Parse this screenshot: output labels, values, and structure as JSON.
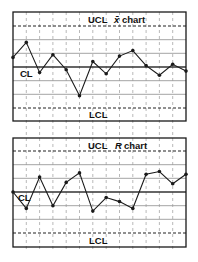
{
  "chart_data": [
    {
      "type": "line",
      "title": "x̄ chart",
      "title_symbol": "x̄",
      "title_suffix": "chart",
      "xlabel": "",
      "ylabel": "",
      "units": "sigma units relative to CL (estimated from gridlines)",
      "x": [
        1,
        2,
        3,
        4,
        5,
        6,
        7,
        8,
        9,
        10,
        11,
        12,
        13,
        14
      ],
      "values": [
        0.7,
        1.8,
        -0.4,
        0.9,
        -0.2,
        -2.1,
        0.4,
        -0.5,
        0.8,
        1.2,
        0.1,
        -0.6,
        0.2,
        -0.3
      ],
      "ylim": [
        -3.9,
        4.0
      ],
      "reference_lines": [
        {
          "label": "UCL",
          "value": 3,
          "style": "dashed"
        },
        {
          "label": "",
          "value": 2,
          "style": "solid-gray"
        },
        {
          "label": "",
          "value": 1,
          "style": "solid-gray"
        },
        {
          "label": "CL",
          "value": 0,
          "style": "solid-dark"
        },
        {
          "label": "",
          "value": -1,
          "style": "solid-gray"
        },
        {
          "label": "",
          "value": -2,
          "style": "solid-gray"
        },
        {
          "label": "LCL",
          "value": -3,
          "style": "dashed"
        }
      ],
      "grid": true,
      "legend": "none"
    },
    {
      "type": "line",
      "title": "R chart",
      "title_symbol": "R",
      "title_suffix": "chart",
      "xlabel": "",
      "ylabel": "",
      "units": "sigma units relative to CL (estimated from gridlines)",
      "x": [
        1,
        2,
        3,
        4,
        5,
        6,
        7,
        8,
        9,
        10,
        11,
        12,
        13,
        14
      ],
      "values": [
        0.0,
        -1.2,
        1.1,
        -1.0,
        0.7,
        1.4,
        -1.4,
        -0.4,
        -0.7,
        -1.2,
        1.3,
        1.5,
        0.6,
        1.3
      ],
      "ylim": [
        -4.0,
        4.0
      ],
      "reference_lines": [
        {
          "label": "UCL",
          "value": 3,
          "style": "dashed"
        },
        {
          "label": "",
          "value": 2,
          "style": "solid-gray"
        },
        {
          "label": "",
          "value": 1,
          "style": "solid-gray"
        },
        {
          "label": "CL",
          "value": 0,
          "style": "solid-dark"
        },
        {
          "label": "",
          "value": -1,
          "style": "solid-gray"
        },
        {
          "label": "",
          "value": -2,
          "style": "solid-gray"
        },
        {
          "label": "LCL",
          "value": -3,
          "style": "dashed"
        }
      ],
      "grid": true,
      "legend": "none"
    }
  ],
  "labels": {
    "xbar": {
      "ucl": "UCL",
      "cl": "CL",
      "lcl": "LCL",
      "title_symbol": "x̄",
      "title_suffix": "chart"
    },
    "r": {
      "ucl": "UCL",
      "cl": "CL",
      "lcl": "LCL",
      "title_symbol": "R",
      "title_suffix": "chart"
    }
  },
  "colors": {
    "frame": "#1a1a1a",
    "series": "#1a1a1a",
    "center_line": "#333333",
    "sigma_lines": "#9a9a9a",
    "limit_lines": "#222222",
    "vertical_guides": "#8a8a8a",
    "background": "#ffffff"
  }
}
